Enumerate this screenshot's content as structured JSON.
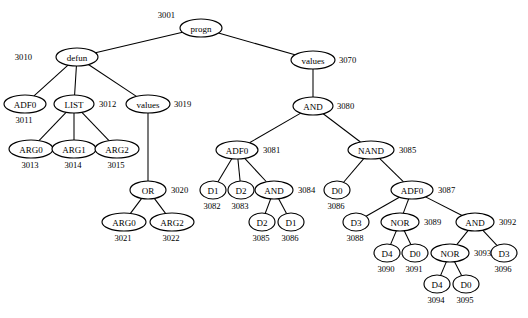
{
  "diagram": {
    "background_color": "#ffffff",
    "stroke_color": "#000000",
    "node_fill": "#ffffff",
    "node_shape": "ellipse"
  },
  "nodes": [
    {
      "id": "3001",
      "label": "progn",
      "x": 201,
      "y": 28,
      "rx": 21,
      "ry": 9,
      "font": 9.0,
      "id_pos": "left-up",
      "id_dx": -26,
      "id_dy": -13
    },
    {
      "id": "3010",
      "label": "defun",
      "x": 77,
      "y": 57,
      "rx": 21,
      "ry": 9,
      "font": 9.0,
      "id_pos": "left",
      "id_dx": -45,
      "id_dy": 0
    },
    {
      "id": "3070",
      "label": "values",
      "x": 313,
      "y": 60,
      "rx": 22,
      "ry": 9,
      "font": 9.0,
      "id_pos": "right",
      "id_dx": 26,
      "id_dy": 0
    },
    {
      "id": "3011",
      "label": "ADF0",
      "x": 25,
      "y": 104,
      "rx": 21,
      "ry": 9,
      "font": 9.0,
      "id_pos": "below",
      "id_dx": -1,
      "id_dy": 16
    },
    {
      "id": "3012",
      "label": "LIST",
      "x": 74,
      "y": 104,
      "rx": 20,
      "ry": 9,
      "font": 9.0,
      "id_pos": "right",
      "id_dx": 25,
      "id_dy": 0
    },
    {
      "id": "3019",
      "label": "values",
      "x": 148,
      "y": 104,
      "rx": 22,
      "ry": 9,
      "font": 9.0,
      "id_pos": "right",
      "id_dx": 26,
      "id_dy": 0
    },
    {
      "id": "3080",
      "label": "AND",
      "x": 313,
      "y": 106,
      "rx": 20,
      "ry": 9,
      "font": 9.0,
      "id_pos": "right",
      "id_dx": 24,
      "id_dy": 0
    },
    {
      "id": "3013",
      "label": "ARG0",
      "x": 31,
      "y": 149,
      "rx": 22,
      "ry": 9,
      "font": 9.0,
      "id_pos": "below",
      "id_dx": -1,
      "id_dy": 16
    },
    {
      "id": "3014",
      "label": "ARG1",
      "x": 74,
      "y": 149,
      "rx": 22,
      "ry": 9,
      "font": 9.0,
      "id_pos": "below",
      "id_dx": -1,
      "id_dy": 16
    },
    {
      "id": "3015",
      "label": "ARG2",
      "x": 117,
      "y": 149,
      "rx": 22,
      "ry": 9,
      "font": 9.0,
      "id_pos": "below",
      "id_dx": -1,
      "id_dy": 16
    },
    {
      "id": "3081",
      "label": "ADF0",
      "x": 237,
      "y": 150,
      "rx": 21,
      "ry": 9,
      "font": 9.0,
      "id_pos": "right",
      "id_dx": 26,
      "id_dy": 0
    },
    {
      "id": "3085",
      "label": "NAND",
      "x": 371,
      "y": 150,
      "rx": 23,
      "ry": 9,
      "font": 9.0,
      "id_pos": "right",
      "id_dx": 28,
      "id_dy": 0
    },
    {
      "id": "3020",
      "label": "OR",
      "x": 148,
      "y": 190,
      "rx": 18,
      "ry": 9,
      "font": 9.0,
      "id_pos": "right",
      "id_dx": 23,
      "id_dy": 0
    },
    {
      "id": "3082",
      "label": "D1",
      "x": 213,
      "y": 190,
      "rx": 13,
      "ry": 9,
      "font": 9.0,
      "id_pos": "below",
      "id_dx": -1,
      "id_dy": 16
    },
    {
      "id": "3083",
      "label": "D2",
      "x": 241,
      "y": 190,
      "rx": 13,
      "ry": 9,
      "font": 9.0,
      "id_pos": "below",
      "id_dx": -1,
      "id_dy": 16
    },
    {
      "id": "3084",
      "label": "AND",
      "x": 274,
      "y": 190,
      "rx": 19,
      "ry": 9,
      "font": 9.0,
      "id_pos": "right",
      "id_dx": 24,
      "id_dy": 0
    },
    {
      "id": "3086",
      "label": "D0",
      "x": 337,
      "y": 190,
      "rx": 13,
      "ry": 9,
      "font": 9.0,
      "id_pos": "below",
      "id_dx": -1,
      "id_dy": 16
    },
    {
      "id": "3087",
      "label": "ADF0",
      "x": 412,
      "y": 190,
      "rx": 21,
      "ry": 9,
      "font": 9.0,
      "id_pos": "right",
      "id_dx": 26,
      "id_dy": 0
    },
    {
      "id": "3021",
      "label": "ARG0",
      "x": 124,
      "y": 222,
      "rx": 22,
      "ry": 9,
      "font": 9.0,
      "id_pos": "below",
      "id_dx": -1,
      "id_dy": 16
    },
    {
      "id": "3022",
      "label": "ARG2",
      "x": 172,
      "y": 222,
      "rx": 22,
      "ry": 9,
      "font": 9.0,
      "id_pos": "below",
      "id_dx": -1,
      "id_dy": 16
    },
    {
      "id": "3085b",
      "label": "D2",
      "x": 262,
      "y": 222,
      "rx": 13,
      "ry": 9,
      "font": 9.0,
      "id_pos": "below",
      "id_dx": -1,
      "id_dy": 16,
      "display_id": "3085"
    },
    {
      "id": "3086b",
      "label": "D1",
      "x": 291,
      "y": 222,
      "rx": 13,
      "ry": 9,
      "font": 9.0,
      "id_pos": "below",
      "id_dx": -1,
      "id_dy": 16,
      "display_id": "3086"
    },
    {
      "id": "3088",
      "label": "D3",
      "x": 356,
      "y": 222,
      "rx": 13,
      "ry": 9,
      "font": 9.0,
      "id_pos": "below",
      "id_dx": -1,
      "id_dy": 16
    },
    {
      "id": "3089",
      "label": "NOR",
      "x": 400,
      "y": 222,
      "rx": 19,
      "ry": 9,
      "font": 9.0,
      "id_pos": "right",
      "id_dx": 24,
      "id_dy": 0
    },
    {
      "id": "3092",
      "label": "AND",
      "x": 475,
      "y": 222,
      "rx": 19,
      "ry": 9,
      "font": 9.0,
      "id_pos": "right",
      "id_dx": 24,
      "id_dy": 0
    },
    {
      "id": "3090",
      "label": "D4",
      "x": 387,
      "y": 253,
      "rx": 13,
      "ry": 9,
      "font": 9.0,
      "id_pos": "below",
      "id_dx": -1,
      "id_dy": 16
    },
    {
      "id": "3091",
      "label": "D0",
      "x": 415,
      "y": 253,
      "rx": 13,
      "ry": 9,
      "font": 9.0,
      "id_pos": "below",
      "id_dx": -1,
      "id_dy": 16
    },
    {
      "id": "3093",
      "label": "NOR",
      "x": 450,
      "y": 253,
      "rx": 19,
      "ry": 9,
      "font": 9.0,
      "id_pos": "right",
      "id_dx": 24,
      "id_dy": 0
    },
    {
      "id": "3096",
      "label": "D3",
      "x": 504,
      "y": 253,
      "rx": 13,
      "ry": 9,
      "font": 9.0,
      "id_pos": "below",
      "id_dx": -1,
      "id_dy": 16
    },
    {
      "id": "3094",
      "label": "D4",
      "x": 437,
      "y": 284,
      "rx": 13,
      "ry": 9,
      "font": 9.0,
      "id_pos": "below",
      "id_dx": -1,
      "id_dy": 16
    },
    {
      "id": "3095",
      "label": "D0",
      "x": 466,
      "y": 284,
      "rx": 13,
      "ry": 9,
      "font": 9.0,
      "id_pos": "below",
      "id_dx": -1,
      "id_dy": 16
    }
  ],
  "edges": [
    {
      "from": "3001",
      "to": "3010"
    },
    {
      "from": "3001",
      "to": "3070"
    },
    {
      "from": "3010",
      "to": "3011"
    },
    {
      "from": "3010",
      "to": "3012"
    },
    {
      "from": "3010",
      "to": "3019"
    },
    {
      "from": "3012",
      "to": "3013"
    },
    {
      "from": "3012",
      "to": "3014"
    },
    {
      "from": "3012",
      "to": "3015"
    },
    {
      "from": "3019",
      "to": "3020"
    },
    {
      "from": "3020",
      "to": "3021"
    },
    {
      "from": "3020",
      "to": "3022"
    },
    {
      "from": "3070",
      "to": "3080"
    },
    {
      "from": "3080",
      "to": "3081"
    },
    {
      "from": "3080",
      "to": "3085"
    },
    {
      "from": "3081",
      "to": "3082"
    },
    {
      "from": "3081",
      "to": "3083"
    },
    {
      "from": "3081",
      "to": "3084"
    },
    {
      "from": "3084",
      "to": "3085b"
    },
    {
      "from": "3084",
      "to": "3086b"
    },
    {
      "from": "3085",
      "to": "3086"
    },
    {
      "from": "3085",
      "to": "3087"
    },
    {
      "from": "3087",
      "to": "3088"
    },
    {
      "from": "3087",
      "to": "3089"
    },
    {
      "from": "3087",
      "to": "3092"
    },
    {
      "from": "3089",
      "to": "3090"
    },
    {
      "from": "3089",
      "to": "3091"
    },
    {
      "from": "3092",
      "to": "3093"
    },
    {
      "from": "3092",
      "to": "3096"
    },
    {
      "from": "3093",
      "to": "3094"
    },
    {
      "from": "3093",
      "to": "3095"
    }
  ]
}
